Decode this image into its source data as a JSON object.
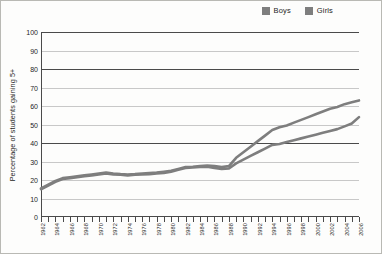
{
  "chart_data": {
    "type": "line",
    "title": "",
    "xlabel": "",
    "ylabel": "Percentage of students gaining 5+",
    "ylim": [
      0,
      100
    ],
    "ytick_step": 10,
    "yticks": [
      0,
      10,
      20,
      30,
      40,
      50,
      60,
      70,
      80,
      90,
      100
    ],
    "grid": true,
    "legend_position": "top-right",
    "x": [
      1962,
      1963,
      1964,
      1965,
      1966,
      1967,
      1968,
      1969,
      1970,
      1971,
      1972,
      1973,
      1974,
      1975,
      1976,
      1977,
      1978,
      1979,
      1980,
      1981,
      1982,
      1983,
      1984,
      1985,
      1986,
      1987,
      1988,
      1989,
      1990,
      1991,
      1992,
      1993,
      1994,
      1995,
      1996,
      1997,
      1998,
      1999,
      2000,
      2001,
      2002,
      2003,
      2004,
      2005,
      2006
    ],
    "xtick_labels": [
      "1962",
      "1964",
      "1966",
      "1968",
      "1970",
      "1972",
      "1974",
      "1976",
      "1978",
      "1980",
      "1982",
      "1984",
      "1986",
      "1988",
      "1990",
      "1992",
      "1994",
      "1996",
      "1998",
      "2000",
      "2002",
      "2004",
      "2006"
    ],
    "series": [
      {
        "name": "Boys",
        "color": "#7e7e7e",
        "values": [
          15,
          17,
          19,
          20.5,
          21,
          21.5,
          22,
          22.5,
          23,
          23.5,
          23,
          22.8,
          22.5,
          22.8,
          23,
          23.2,
          23.5,
          23.8,
          24.5,
          25.5,
          26.5,
          26.8,
          27,
          27.2,
          26.5,
          26,
          26.2,
          29,
          31,
          33,
          35,
          37,
          39,
          39.5,
          40.5,
          41.5,
          42.5,
          43.5,
          44.5,
          45.5,
          46.5,
          47.5,
          49,
          50.5,
          54
        ]
      },
      {
        "name": "Girls",
        "color": "#7e7e7e",
        "values": [
          15.5,
          17.5,
          19.5,
          21,
          21.5,
          22,
          22.5,
          23,
          23.5,
          24,
          23.5,
          23.2,
          23,
          23.2,
          23.5,
          23.8,
          24,
          24.5,
          25,
          26,
          27,
          27.2,
          27.5,
          27.8,
          27.5,
          27,
          27.5,
          32,
          35,
          38,
          41,
          44,
          47,
          48.5,
          49.5,
          51,
          52.5,
          54,
          55.5,
          57,
          58.5,
          59.5,
          61,
          62,
          63
        ]
      }
    ]
  },
  "legend": {
    "entries": [
      {
        "label": "Boys",
        "swatch_name": "legend-swatch-boys"
      },
      {
        "label": "Girls",
        "swatch_name": "legend-swatch-girls"
      }
    ]
  },
  "axes": {
    "y_title": "Percentage of students gaining 5+"
  }
}
